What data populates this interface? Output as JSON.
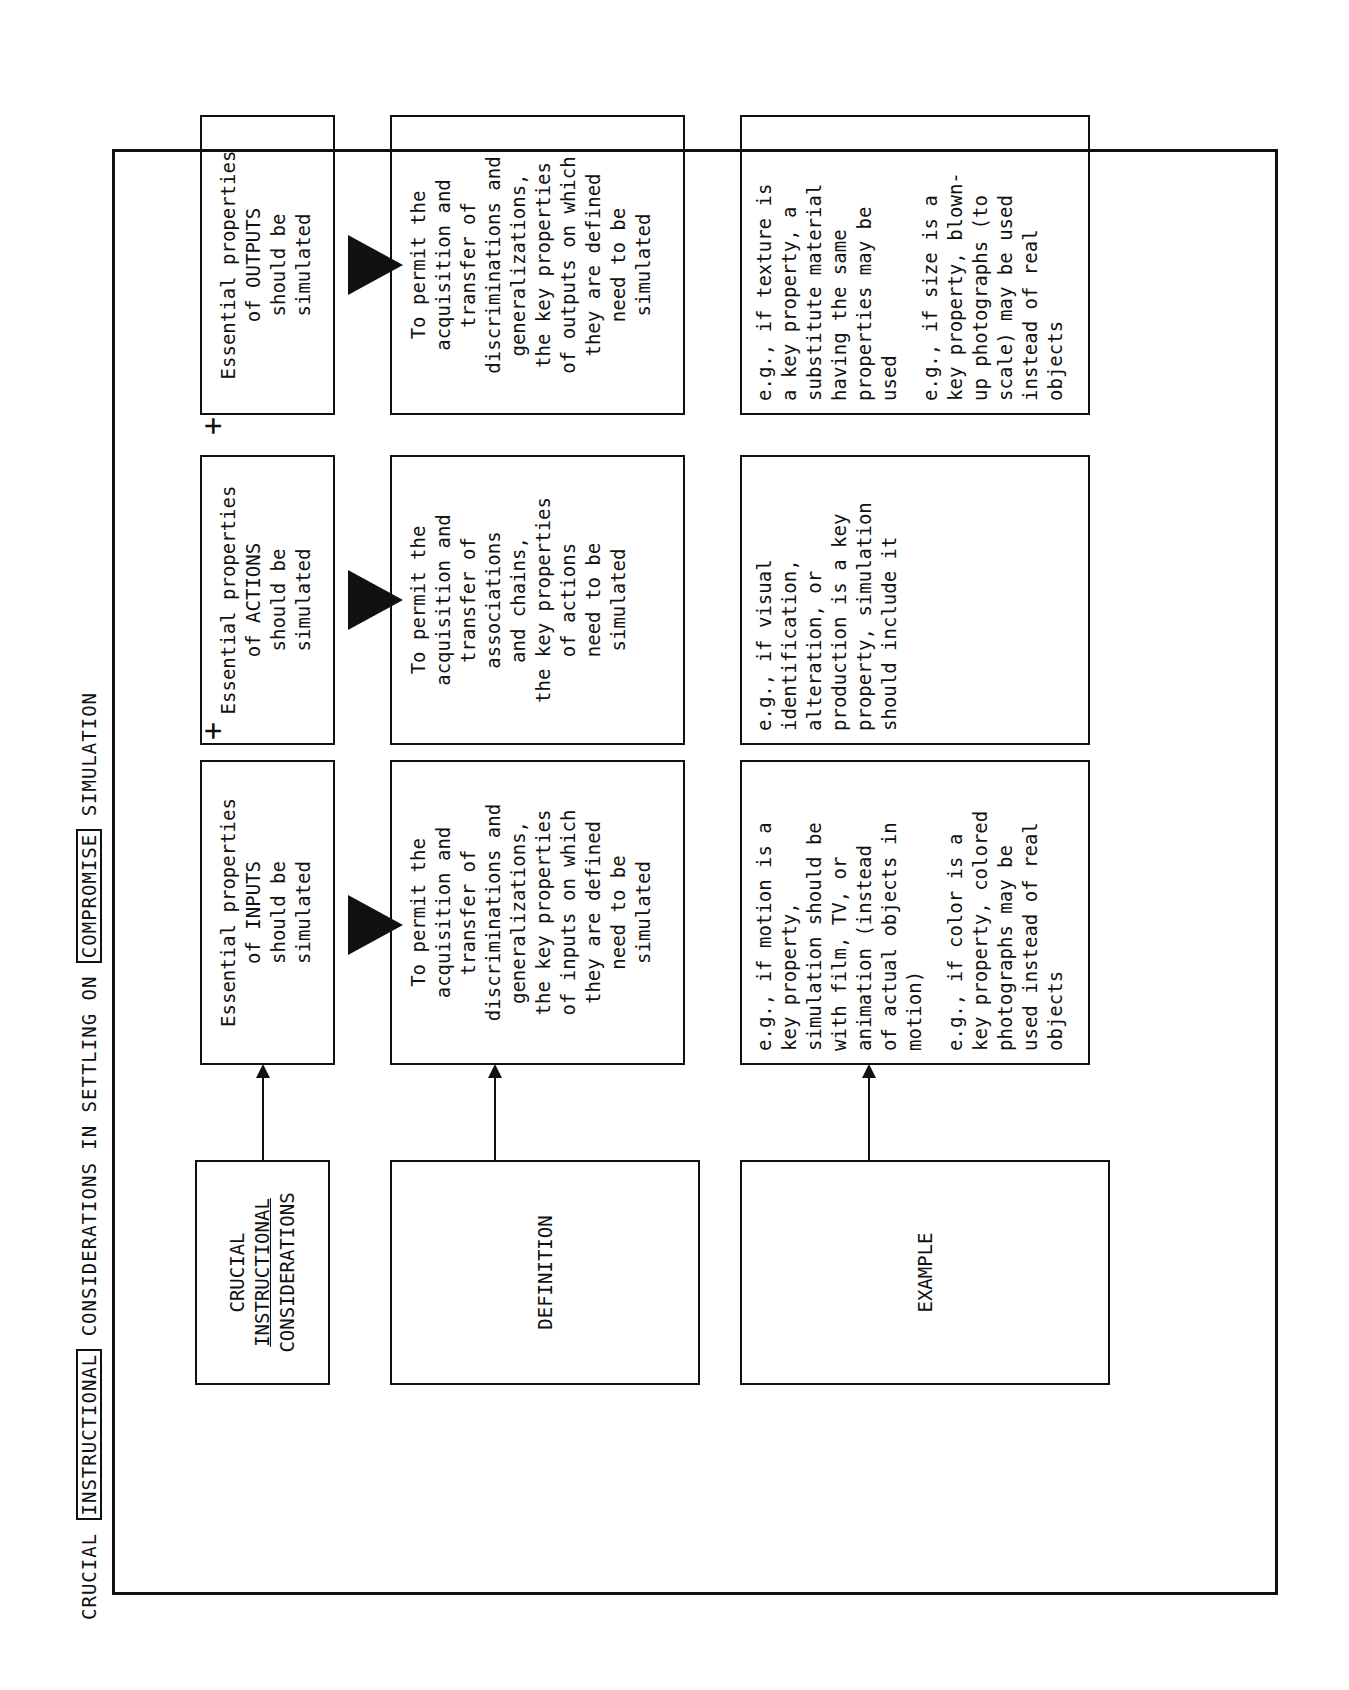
{
  "title": {
    "part1": "CRUCIAL ",
    "boxed1": "INSTRUCTIONAL",
    "part2": " CONSIDERATIONS IN SETTLING ON ",
    "boxed2": "COMPROMISE",
    "part3": " SIMULATION"
  },
  "rows": {
    "considerations": {
      "label_line1": "CRUCIAL",
      "label_line2": "INSTRUCTIONAL",
      "label_line3": "CONSIDERATIONS"
    },
    "definition": {
      "label": "DEFINITION"
    },
    "example": {
      "label": "EXAMPLE"
    }
  },
  "columns": [
    {
      "heading": [
        "Essential properties",
        "of INPUTS",
        "should be",
        "simulated"
      ],
      "definition": [
        "To permit the",
        "acquisition and",
        "transfer of",
        "discriminations and",
        "generalizations,",
        "the key properties",
        "of inputs on which",
        "they are defined",
        "need to be",
        "simulated"
      ],
      "example1": [
        "e.g., if motion is a",
        "key property,",
        "simulation should be",
        "with film, TV, or",
        "animation (instead",
        "of actual objects in",
        "motion)"
      ],
      "example2": [
        "e.g., if color is a",
        "key property, colored",
        "photographs may be",
        "used instead of real",
        "objects"
      ]
    },
    {
      "heading": [
        "Essential properties",
        "of ACTIONS",
        "should be",
        "simulated"
      ],
      "definition": [
        "To permit the",
        "acquisition and",
        "transfer of",
        "associations",
        "and chains,",
        "the key properties",
        "of actions",
        "need to be",
        "simulated"
      ],
      "example1": [
        "e.g., if visual",
        "identification,",
        "alteration, or",
        "production is a key",
        "property, simulation",
        "should include it"
      ]
    },
    {
      "heading": [
        "Essential properties",
        "of OUTPUTS",
        "should be",
        "simulated"
      ],
      "definition": [
        "To permit the",
        "acquisition and",
        "transfer of",
        "discriminations and",
        "generalizations,",
        "the key properties",
        "of outputs on which",
        "they are defined",
        "need to be",
        "simulated"
      ],
      "example1": [
        "e.g., if texture is",
        "a key property, a",
        "substitute material",
        "having the same",
        "properties may be",
        "used"
      ],
      "example2": [
        "e.g., if size is a",
        "key property, blown-",
        "up photographs (to",
        "scale) may be used",
        "instead of real",
        "objects"
      ]
    }
  ],
  "connectors": {
    "plus": "+"
  }
}
